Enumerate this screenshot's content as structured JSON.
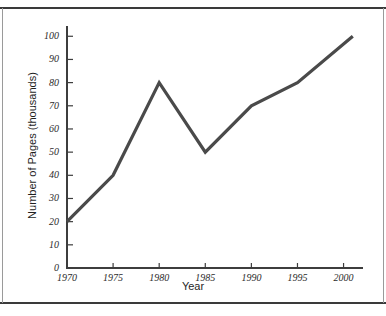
{
  "chart_data": {
    "type": "line",
    "title": "",
    "xlabel": "Year",
    "ylabel": "Number of Pages (thousands)",
    "x": [
      1970,
      1975,
      1980,
      1985,
      1990,
      1995,
      2001
    ],
    "values": [
      20,
      40,
      80,
      50,
      70,
      80,
      100
    ],
    "series": [
      {
        "name": "Number of Pages",
        "values": [
          20,
          40,
          80,
          50,
          70,
          80,
          100
        ]
      }
    ],
    "xlim": [
      1970,
      2002
    ],
    "ylim": [
      0,
      104
    ],
    "xticks": [
      1970,
      1975,
      1980,
      1985,
      1990,
      1995,
      2000
    ],
    "xticklabels": [
      "1970",
      "1975",
      "1980",
      "1985",
      "1990",
      "1995",
      "2000"
    ],
    "yticks": [
      0,
      10,
      20,
      30,
      40,
      50,
      60,
      70,
      80,
      90,
      100
    ],
    "yticklabels": [
      "0",
      "10",
      "20",
      "30",
      "40",
      "50",
      "60",
      "70",
      "80",
      "90",
      "100"
    ],
    "grid": false,
    "legend": null,
    "line_color": "#4a4a4a",
    "axis_color": "#3d3d3d",
    "background": "#ffffff"
  },
  "figure": {
    "border_color": "#3a3a3a"
  }
}
